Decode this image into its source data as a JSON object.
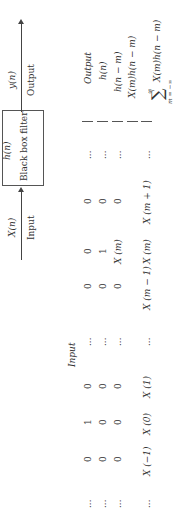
{
  "diagram": {
    "input_signal": "X(n)",
    "input_label": "Input",
    "filter_response": "h(n)",
    "filter_label": "Black box filter",
    "output_signal": "y(n)",
    "output_label": "Output"
  },
  "table": {
    "rows": [
      {
        "cells": [
          "...",
          "0",
          "1",
          "0",
          "...",
          "0",
          "0",
          "0",
          "..."
        ],
        "right": "Output",
        "header_italic": "Input"
      },
      {
        "cells": [
          "...",
          "0",
          "0",
          "0",
          "...",
          "0",
          "1",
          "0",
          "..."
        ],
        "right": "h(n)"
      },
      {
        "cells": [
          "...",
          "0",
          "0",
          "0",
          "...",
          "0",
          "X (m)",
          "0",
          "..."
        ],
        "right": "h(n − m)"
      },
      {
        "cells": [
          "...",
          "X (−1)",
          "X (0)",
          "X (1)",
          "...",
          "X (m − 1)",
          "X (m)",
          "X (m + 1)",
          "..."
        ],
        "right": "X(m)h(n − m)"
      },
      {
        "right_sum": "X(m)h(n − m)",
        "sum_lower": "m = −∞",
        "sum_upper": "∞",
        "sum_symbol": "∑"
      }
    ],
    "input_header": "Input"
  }
}
